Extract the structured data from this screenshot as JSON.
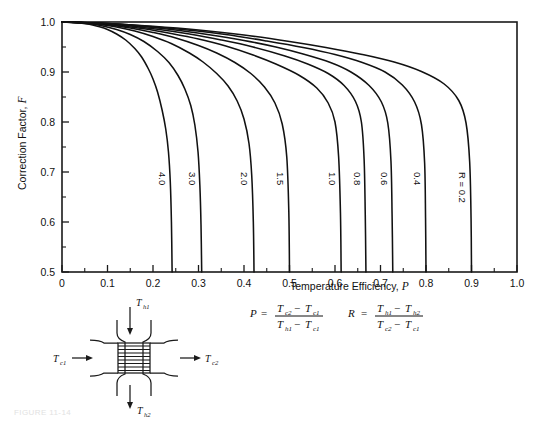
{
  "figure": {
    "kind": "lmtd-correction-factor-chart",
    "caption_faint": "FIGURE 11-14"
  },
  "chart_data": {
    "type": "line",
    "title": "",
    "xlabel": "Temperature Efficiency, P",
    "ylabel": "Correction Factor, F",
    "xlim": [
      0,
      1.0
    ],
    "ylim": [
      0.5,
      1.0
    ],
    "grid": false,
    "legend_position": "inline-curve-labels",
    "x_ticks": [
      "0",
      "0.1",
      "0.2",
      "0.3",
      "0.4",
      "0.5",
      "0.6",
      "0.7",
      "0.8",
      "0.9",
      "1.0"
    ],
    "x_tick_values": [
      0,
      0.1,
      0.2,
      0.3,
      0.4,
      0.5,
      0.6,
      0.7,
      0.8,
      0.9,
      1.0
    ],
    "x_minor_step": 0.05,
    "y_ticks": [
      "0.5",
      "0.6",
      "0.7",
      "0.8",
      "0.9",
      "1.0"
    ],
    "y_tick_values": [
      0.5,
      0.6,
      0.7,
      0.8,
      0.9,
      1.0
    ],
    "y_minor_step": 0.05,
    "series_parameter": "R",
    "series": [
      {
        "name": "4.0",
        "label": "4.0",
        "R": 4.0,
        "x": [
          0.0,
          0.02,
          0.04,
          0.06,
          0.08,
          0.1,
          0.12,
          0.14,
          0.16,
          0.175,
          0.19,
          0.2,
          0.21,
          0.22,
          0.228,
          0.234,
          0.238,
          0.2405,
          0.242
        ],
        "y": [
          1.0,
          0.9995,
          0.998,
          0.9955,
          0.991,
          0.985,
          0.976,
          0.964,
          0.947,
          0.93,
          0.906,
          0.886,
          0.86,
          0.824,
          0.786,
          0.74,
          0.68,
          0.6,
          0.5
        ]
      },
      {
        "name": "3.0",
        "label": "3.0",
        "R": 3.0,
        "x": [
          0.0,
          0.03,
          0.06,
          0.09,
          0.12,
          0.15,
          0.18,
          0.21,
          0.235,
          0.255,
          0.27,
          0.283,
          0.292,
          0.299,
          0.303,
          0.3055,
          0.307
        ],
        "y": [
          1.0,
          0.9992,
          0.9965,
          0.992,
          0.985,
          0.975,
          0.961,
          0.941,
          0.919,
          0.893,
          0.866,
          0.833,
          0.794,
          0.74,
          0.673,
          0.595,
          0.5
        ]
      },
      {
        "name": "2.0",
        "label": "2.0",
        "R": 2.0,
        "x": [
          0.0,
          0.04,
          0.08,
          0.12,
          0.16,
          0.2,
          0.24,
          0.28,
          0.31,
          0.34,
          0.365,
          0.385,
          0.4,
          0.411,
          0.417,
          0.4205,
          0.422
        ],
        "y": [
          1.0,
          0.9988,
          0.9955,
          0.99,
          0.982,
          0.971,
          0.957,
          0.938,
          0.92,
          0.897,
          0.872,
          0.842,
          0.806,
          0.757,
          0.693,
          0.6,
          0.5
        ]
      },
      {
        "name": "1.5",
        "label": "1.5",
        "R": 1.5,
        "x": [
          0.0,
          0.05,
          0.1,
          0.15,
          0.2,
          0.25,
          0.3,
          0.34,
          0.38,
          0.415,
          0.445,
          0.468,
          0.484,
          0.494,
          0.4985,
          0.5
        ],
        "y": [
          1.0,
          0.9985,
          0.9945,
          0.988,
          0.979,
          0.968,
          0.953,
          0.938,
          0.919,
          0.897,
          0.87,
          0.838,
          0.796,
          0.73,
          0.62,
          0.5
        ]
      },
      {
        "name": "1.0",
        "label": "1.0",
        "R": 1.0,
        "x": [
          0.0,
          0.06,
          0.12,
          0.18,
          0.24,
          0.3,
          0.36,
          0.42,
          0.47,
          0.52,
          0.56,
          0.585,
          0.6,
          0.608,
          0.612,
          0.6135
        ],
        "y": [
          1.0,
          0.9982,
          0.9935,
          0.9865,
          0.977,
          0.966,
          0.952,
          0.934,
          0.916,
          0.894,
          0.868,
          0.838,
          0.8,
          0.73,
          0.618,
          0.5
        ]
      },
      {
        "name": "0.8",
        "label": "0.8",
        "R": 0.8,
        "x": [
          0.0,
          0.07,
          0.14,
          0.21,
          0.28,
          0.35,
          0.42,
          0.49,
          0.54,
          0.585,
          0.62,
          0.645,
          0.658,
          0.664,
          0.6665,
          0.668
        ],
        "y": [
          1.0,
          0.998,
          0.993,
          0.9855,
          0.976,
          0.964,
          0.95,
          0.932,
          0.916,
          0.897,
          0.873,
          0.841,
          0.8,
          0.725,
          0.615,
          0.5
        ]
      },
      {
        "name": "0.6",
        "label": "0.6",
        "R": 0.6,
        "x": [
          0.0,
          0.08,
          0.16,
          0.24,
          0.32,
          0.4,
          0.47,
          0.53,
          0.59,
          0.635,
          0.675,
          0.702,
          0.716,
          0.723,
          0.7255,
          0.727
        ],
        "y": [
          1.0,
          0.9978,
          0.9925,
          0.985,
          0.975,
          0.963,
          0.95,
          0.936,
          0.919,
          0.9,
          0.873,
          0.84,
          0.798,
          0.722,
          0.612,
          0.5
        ]
      },
      {
        "name": "0.4",
        "label": "0.4",
        "R": 0.4,
        "x": [
          0.0,
          0.09,
          0.18,
          0.27,
          0.36,
          0.45,
          0.53,
          0.6,
          0.66,
          0.71,
          0.748,
          0.775,
          0.79,
          0.797,
          0.799,
          0.8
        ],
        "y": [
          1.0,
          0.9975,
          0.992,
          0.9845,
          0.975,
          0.962,
          0.949,
          0.935,
          0.919,
          0.9,
          0.874,
          0.84,
          0.795,
          0.718,
          0.608,
          0.5
        ]
      },
      {
        "name": "0.2",
        "label": "R = 0.2",
        "R": 0.2,
        "x": [
          0.0,
          0.1,
          0.2,
          0.3,
          0.4,
          0.5,
          0.58,
          0.66,
          0.73,
          0.79,
          0.84,
          0.872,
          0.888,
          0.896,
          0.899,
          0.9
        ],
        "y": [
          1.0,
          0.997,
          0.9915,
          0.984,
          0.974,
          0.961,
          0.949,
          0.935,
          0.92,
          0.901,
          0.876,
          0.843,
          0.798,
          0.72,
          0.608,
          0.5
        ]
      }
    ]
  },
  "equations": {
    "p": {
      "lhs": "P",
      "equals": "=",
      "numerator": {
        "t1": "T",
        "s1": "c2",
        "op": "−",
        "t2": "T",
        "s2": "c1"
      },
      "denominator": {
        "t1": "T",
        "s1": "h1",
        "op": "−",
        "t2": "T",
        "s2": "c1"
      }
    },
    "r": {
      "lhs": "R",
      "equals": "=",
      "numerator": {
        "t1": "T",
        "s1": "h1",
        "op": "−",
        "t2": "T",
        "s2": "h2"
      },
      "denominator": {
        "t1": "T",
        "s1": "c2",
        "op": "−",
        "t2": "T",
        "s2": "c1"
      }
    }
  },
  "diagram": {
    "name": "cross-flow-heat-exchanger",
    "streams": [
      {
        "id": "hot-in",
        "base": "T",
        "sub": "h1",
        "position": "top"
      },
      {
        "id": "cold-in",
        "base": "T",
        "sub": "c1",
        "position": "left"
      },
      {
        "id": "cold-out",
        "base": "T",
        "sub": "c2",
        "position": "right"
      },
      {
        "id": "hot-out",
        "base": "T",
        "sub": "h2",
        "position": "bottom"
      }
    ]
  }
}
